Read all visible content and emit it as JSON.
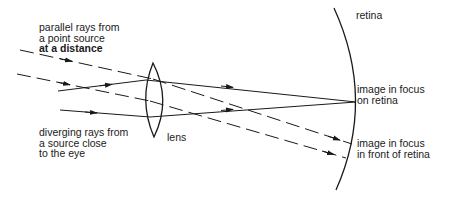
{
  "diagram": {
    "labels": {
      "parallel_rays": [
        "parallel rays from",
        "a point source",
        "at a distance"
      ],
      "diverging_rays": [
        "diverging rays from",
        "a source close",
        "to the eye"
      ],
      "lens": "lens",
      "retina": "retina",
      "focus_on_retina": [
        "image in focus",
        "on retina"
      ],
      "focus_in_front": [
        "image in focus",
        "in front of retina"
      ]
    },
    "colors": {
      "stroke": "#1a1a1a",
      "background": "#ffffff"
    }
  }
}
